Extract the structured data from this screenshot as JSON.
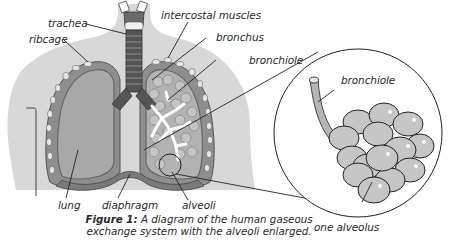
{
  "diagram": {
    "title": "Human gaseous exchange system",
    "labels": {
      "trachea": "trachea",
      "ribcage": "ribcage",
      "intercostal_muscles": "intercostal muscles",
      "bronchus": "bronchus",
      "bronchiole_main": "bronchiole",
      "bronchiole_inset": "bronchiole",
      "lung": "lung",
      "diaphragm": "diaphragm",
      "alveoli": "alveoli",
      "one_alveolus": "one alveolus"
    },
    "caption": {
      "prefix": "Figure 1:",
      "line1": "A diagram of the human gaseous",
      "line2": "exchange system with the alveoli enlarged."
    },
    "colors": {
      "body_silhouette": "#d6d6d6",
      "lung_fill": "#a9a9a9",
      "lung_border": "#7d7d7d",
      "alveoli_fill": "#c6c6c6",
      "outline": "#222222",
      "airway": "#ffffff",
      "trachea": "#5a5a5a"
    }
  }
}
